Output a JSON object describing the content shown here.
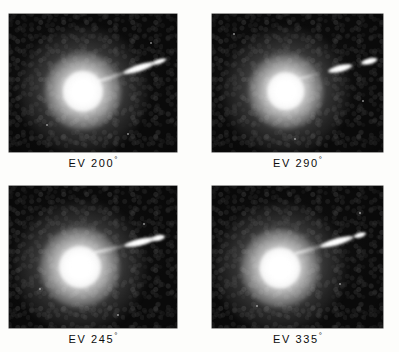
{
  "figure": {
    "kind": "photographic-plate-grid",
    "background_color": "#fdfdfb",
    "plate_color": "#0a0a0a",
    "feature_color": "#ffffff",
    "caption_color": "#0c0c0c",
    "rows": 2,
    "columns": 2
  },
  "panels": [
    {
      "id": "panel-ev-200",
      "caption": "EV 200",
      "degree_symbol": "°",
      "caption_full": "EV 200°",
      "position": "top-left",
      "plate": {
        "left": 9,
        "top": 14,
        "width": 168,
        "height": 138
      },
      "caption_box": {
        "left": 9,
        "top": 155,
        "width": 168
      },
      "coma": {
        "cx_pct": 44,
        "cy_pct": 56,
        "outer_pct": 76,
        "mid_pct": 46,
        "core_pct": 24
      },
      "jet": {
        "origin_x_pct": 52,
        "origin_y_pct": 49,
        "angle_deg": -18,
        "bridge": {
          "left_pct": 0,
          "width_pct": 26,
          "height_px": 4
        },
        "segments": [
          {
            "left_pct": 17,
            "width_pct": 20,
            "height_px": 7
          },
          {
            "left_pct": 35,
            "width_pct": 9,
            "height_px": 5
          }
        ]
      },
      "specks": [
        {
          "x_pct": 84,
          "y_pct": 20,
          "size": 2
        },
        {
          "x_pct": 22,
          "y_pct": 80,
          "size": 2
        },
        {
          "x_pct": 70,
          "y_pct": 86,
          "size": 2
        }
      ]
    },
    {
      "id": "panel-ev-290",
      "caption": "EV 290",
      "degree_symbol": "°",
      "caption_full": "EV 290°",
      "position": "top-right",
      "plate": {
        "left": 212,
        "top": 14,
        "width": 171,
        "height": 138
      },
      "caption_box": {
        "left": 212,
        "top": 155,
        "width": 171
      },
      "coma": {
        "cx_pct": 43,
        "cy_pct": 56,
        "outer_pct": 74,
        "mid_pct": 44,
        "core_pct": 22
      },
      "jet": {
        "origin_x_pct": 50,
        "origin_y_pct": 47,
        "angle_deg": -14,
        "bridge": {
          "left_pct": 0,
          "width_pct": 14,
          "height_px": 3
        },
        "segments": [
          {
            "left_pct": 18,
            "width_pct": 15,
            "height_px": 7
          },
          {
            "left_pct": 38,
            "width_pct": 10,
            "height_px": 6
          }
        ]
      },
      "specks": [
        {
          "x_pct": 12,
          "y_pct": 14,
          "size": 2
        },
        {
          "x_pct": 88,
          "y_pct": 62,
          "size": 2
        },
        {
          "x_pct": 48,
          "y_pct": 90,
          "size": 2
        }
      ]
    },
    {
      "id": "panel-ev-245",
      "caption": "EV 245",
      "degree_symbol": "°",
      "caption_full": "EV 245°",
      "position": "bottom-left",
      "plate": {
        "left": 9,
        "top": 186,
        "width": 168,
        "height": 142
      },
      "caption_box": {
        "left": 9,
        "top": 331,
        "width": 168
      },
      "coma": {
        "cx_pct": 42,
        "cy_pct": 57,
        "outer_pct": 78,
        "mid_pct": 48,
        "core_pct": 25
      },
      "jet": {
        "origin_x_pct": 50,
        "origin_y_pct": 47,
        "angle_deg": -13,
        "bridge": {
          "left_pct": 0,
          "width_pct": 24,
          "height_px": 4
        },
        "segments": [
          {
            "left_pct": 19,
            "width_pct": 19,
            "height_px": 7
          },
          {
            "left_pct": 36,
            "width_pct": 8,
            "height_px": 6
          }
        ]
      },
      "specks": [
        {
          "x_pct": 80,
          "y_pct": 26,
          "size": 2
        },
        {
          "x_pct": 18,
          "y_pct": 72,
          "size": 2
        },
        {
          "x_pct": 64,
          "y_pct": 90,
          "size": 2
        }
      ]
    },
    {
      "id": "panel-ev-335",
      "caption": "EV 335",
      "degree_symbol": "°",
      "caption_full": "EV 335°",
      "position": "bottom-right",
      "plate": {
        "left": 212,
        "top": 186,
        "width": 171,
        "height": 142
      },
      "caption_box": {
        "left": 212,
        "top": 331,
        "width": 171
      },
      "coma": {
        "cx_pct": 40,
        "cy_pct": 58,
        "outer_pct": 76,
        "mid_pct": 46,
        "core_pct": 24
      },
      "jet": {
        "origin_x_pct": 48,
        "origin_y_pct": 48,
        "angle_deg": -16,
        "bridge": {
          "left_pct": 0,
          "width_pct": 22,
          "height_px": 4
        },
        "segments": [
          {
            "left_pct": 16,
            "width_pct": 20,
            "height_px": 7
          },
          {
            "left_pct": 36,
            "width_pct": 8,
            "height_px": 5
          }
        ]
      },
      "specks": [
        {
          "x_pct": 86,
          "y_pct": 18,
          "size": 2
        },
        {
          "x_pct": 26,
          "y_pct": 84,
          "size": 2
        },
        {
          "x_pct": 74,
          "y_pct": 68,
          "size": 2
        }
      ]
    }
  ]
}
